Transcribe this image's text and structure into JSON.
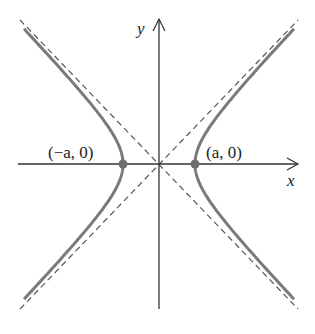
{
  "diagram": {
    "axes": {
      "x_label": "x",
      "y_label": "y"
    },
    "vertices": [
      {
        "label": "(−a, 0)",
        "position": "left"
      },
      {
        "label": "(a, 0)",
        "position": "right"
      }
    ],
    "colors": {
      "curve": "#7a7a7a",
      "axis": "#333333",
      "asymptote": "#555555",
      "vertex": "#6e6e6e"
    }
  }
}
